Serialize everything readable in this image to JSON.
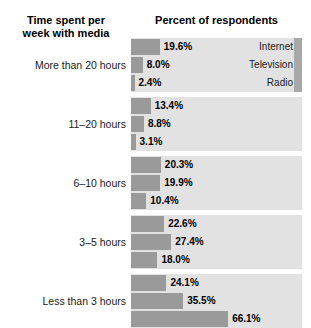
{
  "headers": {
    "left_line1": "Time spent per",
    "left_line2": "week with media",
    "right": "Percent of respondents"
  },
  "colors": {
    "bar": "#9a9a9a",
    "panel": "#e2e2e2",
    "edge_strip": "#a8a8a8",
    "text": "#000000",
    "background": "#ffffff"
  },
  "chart_data": {
    "type": "bar",
    "title": "Percent of respondents",
    "xlabel": "Percent of respondents",
    "ylabel": "Time spent per week with media",
    "orientation": "horizontal",
    "grid": false,
    "legend_position": "inline-right-first-group",
    "xlim": [
      0,
      100
    ],
    "categories": [
      "More than 20 hours",
      "11–20 hours",
      "6–10 hours",
      "3–5 hours",
      "Less than 3 hours"
    ],
    "series": [
      {
        "name": "Internet",
        "values": [
          19.6,
          13.4,
          20.3,
          22.6,
          24.1
        ]
      },
      {
        "name": "Television",
        "values": [
          8.0,
          8.8,
          19.9,
          27.4,
          35.5
        ]
      },
      {
        "name": "Radio",
        "values": [
          2.4,
          3.1,
          10.4,
          18.0,
          66.1
        ]
      }
    ]
  },
  "groups": [
    {
      "label": "More than 20 hours",
      "bars": [
        {
          "series": "Internet",
          "value": 19.6,
          "value_label": "19.6%",
          "legend": "Internet"
        },
        {
          "series": "Television",
          "value": 8.0,
          "value_label": "8.0%",
          "legend": "Television"
        },
        {
          "series": "Radio",
          "value": 2.4,
          "value_label": "2.4%",
          "legend": "Radio"
        }
      ]
    },
    {
      "label": "11–20 hours",
      "bars": [
        {
          "series": "Internet",
          "value": 13.4,
          "value_label": "13.4%",
          "legend": ""
        },
        {
          "series": "Television",
          "value": 8.8,
          "value_label": "8.8%",
          "legend": ""
        },
        {
          "series": "Radio",
          "value": 3.1,
          "value_label": "3.1%",
          "legend": ""
        }
      ]
    },
    {
      "label": "6–10 hours",
      "bars": [
        {
          "series": "Internet",
          "value": 20.3,
          "value_label": "20.3%",
          "legend": ""
        },
        {
          "series": "Television",
          "value": 19.9,
          "value_label": "19.9%",
          "legend": ""
        },
        {
          "series": "Radio",
          "value": 10.4,
          "value_label": "10.4%",
          "legend": ""
        }
      ]
    },
    {
      "label": "3–5 hours",
      "bars": [
        {
          "series": "Internet",
          "value": 22.6,
          "value_label": "22.6%",
          "legend": ""
        },
        {
          "series": "Television",
          "value": 27.4,
          "value_label": "27.4%",
          "legend": ""
        },
        {
          "series": "Radio",
          "value": 18.0,
          "value_label": "18.0%",
          "legend": ""
        }
      ]
    },
    {
      "label": "Less than 3 hours",
      "bars": [
        {
          "series": "Internet",
          "value": 24.1,
          "value_label": "24.1%",
          "legend": ""
        },
        {
          "series": "Television",
          "value": 35.5,
          "value_label": "35.5%",
          "legend": ""
        },
        {
          "series": "Radio",
          "value": 66.1,
          "value_label": "66.1%",
          "legend": ""
        }
      ]
    }
  ]
}
